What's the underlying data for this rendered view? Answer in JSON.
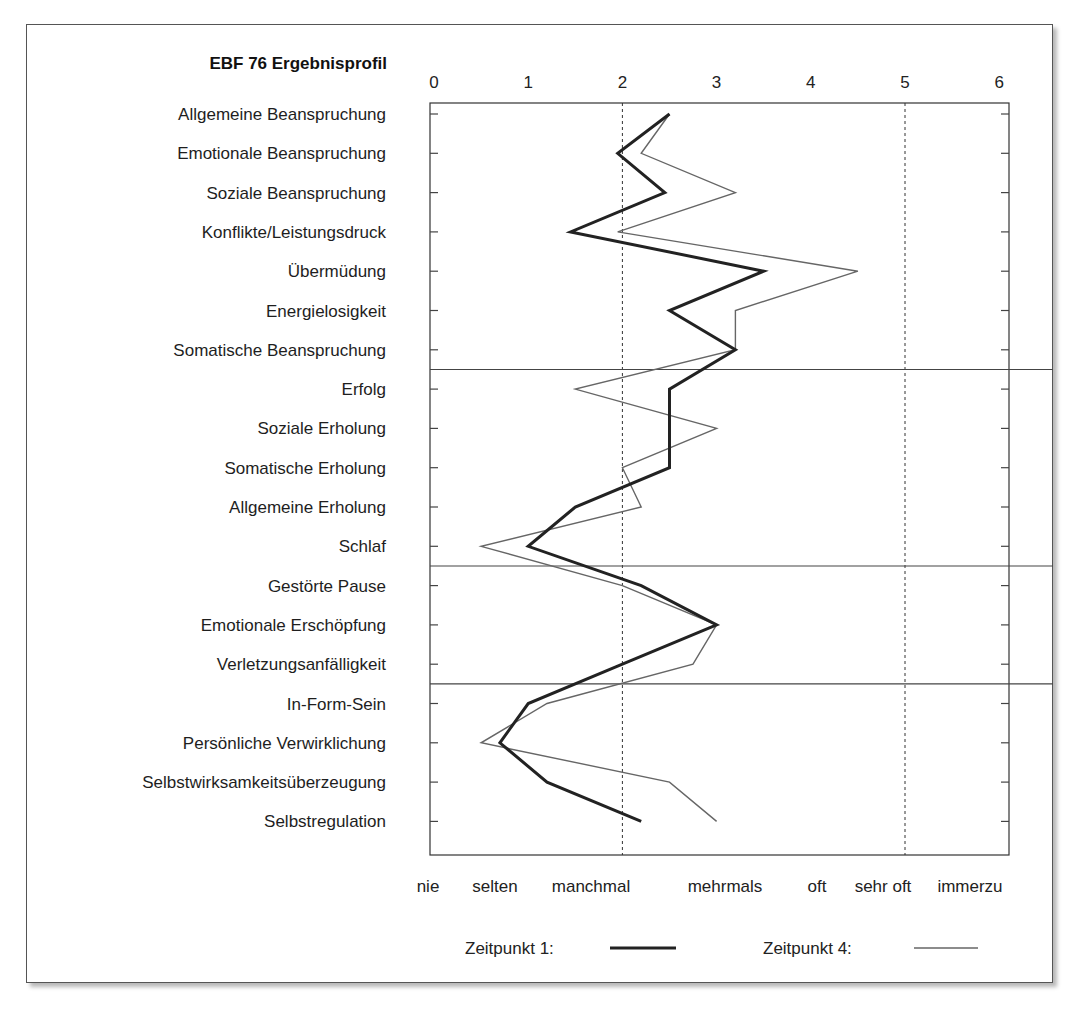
{
  "chart_data": {
    "type": "line",
    "orientation": "horizontal-profile",
    "title": "EBF 76 Ergebnisprofil",
    "x_axis": {
      "range": [
        0,
        6
      ],
      "ticks": [
        "0",
        "1",
        "2",
        "3",
        "4",
        "5",
        "6"
      ],
      "reference_lines_dashed": [
        2,
        5
      ],
      "category_labels": [
        "nie",
        "selten",
        "manchmal",
        "mehrmals",
        "oft",
        "sehr oft",
        "immerzu"
      ]
    },
    "categories": [
      "Allgemeine Beanspruchung",
      "Emotionale Beanspruchung",
      "Soziale Beanspruchung",
      "Konflikte/Leistungsdruck",
      "Übermüdung",
      "Energielosigkeit",
      "Somatische Beanspruchung",
      "Erfolg",
      "Soziale Erholung",
      "Somatische Erholung",
      "Allgemeine Erholung",
      "Schlaf",
      "Gestörte Pause",
      "Emotionale Erschöpfung",
      "Verletzungsanfälligkeit",
      "In-Form-Sein",
      "Persönliche Verwirklichung",
      "Selbstwirksamkeitsüberzeugung",
      "Selbstregulation"
    ],
    "group_separators_after_index": [
      6,
      11,
      14
    ],
    "series": [
      {
        "name": "Zeitpunkt 1",
        "style": "thick",
        "color": "#222222",
        "values": [
          2.5,
          1.95,
          2.45,
          1.45,
          3.5,
          2.5,
          3.2,
          2.5,
          2.5,
          2.5,
          1.5,
          1.0,
          2.2,
          3.0,
          2.0,
          1.0,
          0.7,
          1.2,
          2.2
        ]
      },
      {
        "name": "Zeitpunkt 4",
        "style": "thin",
        "color": "#666666",
        "values": [
          2.5,
          2.2,
          3.2,
          1.95,
          4.5,
          3.2,
          3.2,
          1.5,
          3.0,
          2.0,
          2.2,
          0.5,
          2.0,
          3.0,
          2.75,
          1.2,
          0.5,
          2.5,
          3.0
        ]
      }
    ],
    "legend": {
      "position": "bottom",
      "items": [
        {
          "label": "Zeitpunkt 1:",
          "line": "thick"
        },
        {
          "label": "Zeitpunkt 4:",
          "line": "thin"
        }
      ]
    },
    "grid": false
  }
}
